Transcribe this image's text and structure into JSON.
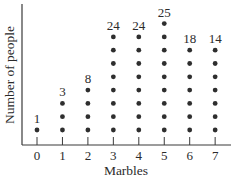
{
  "chart_data": {
    "type": "scatter",
    "subtype": "dot-plot",
    "title": "",
    "xlabel": "Marbles",
    "ylabel": "Number of people",
    "categories": [
      "0",
      "1",
      "2",
      "3",
      "4",
      "5",
      "6",
      "7"
    ],
    "values": [
      1,
      3,
      8,
      24,
      24,
      25,
      18,
      14
    ],
    "dots_per_column": [
      1,
      3,
      4,
      8,
      8,
      9,
      7,
      7
    ],
    "value_labels": [
      "1",
      "3",
      "8",
      "24",
      "24",
      "25",
      "18",
      "14"
    ],
    "grid": false,
    "legend": null,
    "dot_color": "#2e2e2e"
  }
}
